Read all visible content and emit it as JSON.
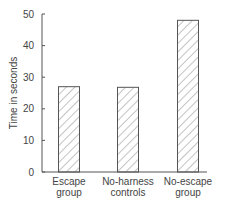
{
  "chart_data": {
    "type": "bar",
    "title": "",
    "xlabel": "",
    "ylabel": "Time in seconds",
    "ylim": [
      0,
      50
    ],
    "yticks": [
      0,
      10,
      20,
      30,
      40,
      50
    ],
    "grid": false,
    "legend": null,
    "bar_style": "hatched",
    "categories": [
      [
        "Escape",
        "group"
      ],
      [
        "No-harness",
        "controls"
      ],
      [
        "No-escape",
        "group"
      ]
    ],
    "category_names": [
      "Escape group",
      "No-harness controls",
      "No-escape group"
    ],
    "values": [
      27,
      26.8,
      48
    ]
  },
  "colors": {
    "axis": "#555555",
    "bar_stroke": "#555555",
    "hatch": "#888888"
  }
}
